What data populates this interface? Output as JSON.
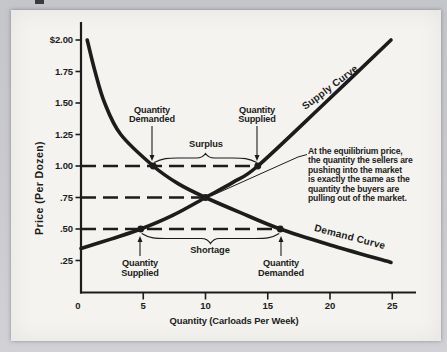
{
  "page": {
    "bg_outer": "#c9c9cd",
    "bg_page": "#f4f3ef",
    "ink": "#1c1c1c"
  },
  "chart_data": {
    "type": "line",
    "title": "",
    "xlabel": "Quantity (Carloads Per Week)",
    "ylabel": "Price (Per Dozen)",
    "xlim": [
      0,
      26
    ],
    "ylim": [
      0,
      2.15
    ],
    "grid": false,
    "legend": "labels-along-curves",
    "x_ticks": [
      {
        "label": "0",
        "q": 0
      },
      {
        "label": "5",
        "q": 5
      },
      {
        "label": "10",
        "q": 10
      },
      {
        "label": "15",
        "q": 15
      },
      {
        "label": "20",
        "q": 20
      },
      {
        "label": "25",
        "q": 25
      }
    ],
    "y_ticks": [
      {
        "label": "$2.00",
        "p": 2.0
      },
      {
        "label": "1.75",
        "p": 1.75
      },
      {
        "label": "1.50",
        "p": 1.5
      },
      {
        "label": "1.25",
        "p": 1.25
      },
      {
        "label": "1.00",
        "p": 1.0
      },
      {
        "label": ".75",
        "p": 0.75
      },
      {
        "label": ".50",
        "p": 0.5
      },
      {
        "label": ".25",
        "p": 0.25
      }
    ],
    "series": [
      {
        "name": "Supply Curve",
        "points": [
          [
            0,
            0.345
          ],
          [
            2.4,
            0.42
          ],
          [
            4.8,
            0.5
          ],
          [
            7.4,
            0.61
          ],
          [
            10,
            0.75
          ],
          [
            12.2,
            0.87
          ],
          [
            14.2,
            1.0
          ],
          [
            19.6,
            1.5
          ],
          [
            24.9,
            2.0
          ]
        ],
        "label_pos": {
          "x": 332,
          "y": 90,
          "angle": -37
        }
      },
      {
        "name": "Demand Curve",
        "points": [
          [
            0.5,
            2.0
          ],
          [
            1.1,
            1.76
          ],
          [
            1.9,
            1.5
          ],
          [
            3.2,
            1.25
          ],
          [
            5.8,
            1.0
          ],
          [
            7.8,
            0.86
          ],
          [
            10,
            0.75
          ],
          [
            12.8,
            0.63
          ],
          [
            16,
            0.5
          ],
          [
            20.3,
            0.365
          ],
          [
            24.9,
            0.235
          ]
        ],
        "label_pos": {
          "x": 349,
          "y": 240,
          "angle": 14.5
        }
      }
    ],
    "equilibrium": {
      "q": 10,
      "p": 0.75
    },
    "key_points": [
      {
        "q": 5.8,
        "p": 1.0
      },
      {
        "q": 14.2,
        "p": 1.0
      },
      {
        "q": 10,
        "p": 0.75
      },
      {
        "q": 4.8,
        "p": 0.5
      },
      {
        "q": 16,
        "p": 0.5
      }
    ],
    "price_lines": [
      {
        "p": 1.0,
        "from_q": 0,
        "to_q": 14.2
      },
      {
        "p": 0.75,
        "from_q": 0,
        "to_q": 10
      },
      {
        "p": 0.5,
        "from_q": 0,
        "to_q": 16
      }
    ],
    "braces": [
      {
        "label": "Surplus",
        "from_q": 5.8,
        "to_q": 14.2,
        "end_y": 162.5,
        "amp": 9,
        "label_x": 206,
        "label_y": 147
      },
      {
        "label": "Shortage",
        "from_q": 4.8,
        "to_q": 16,
        "end_y": 233.5,
        "amp": -10,
        "label_x": 210,
        "label_y": 253
      }
    ],
    "callouts": [
      {
        "lines": [
          "Quantity",
          "Demanded"
        ],
        "x": 152,
        "y1": 112.5,
        "arrow": {
          "x": 152,
          "y_from": 126,
          "y_to": 161
        }
      },
      {
        "lines": [
          "Quantity",
          "Supplied"
        ],
        "x": 257,
        "y1": 112.5,
        "arrow": {
          "x": 257,
          "y_from": 126,
          "y_to": 161
        }
      },
      {
        "lines": [
          "Quantity",
          "Supplied"
        ],
        "x": 140,
        "y1": 266,
        "arrow": {
          "x": 140,
          "y_from": 256,
          "y_to": 236
        }
      },
      {
        "lines": [
          "Quantity",
          "Demanded"
        ],
        "x": 281,
        "y1": 266,
        "arrow": {
          "x": 281,
          "y_from": 256,
          "y_to": 236
        }
      }
    ],
    "annotation": {
      "text": "At the equilibrium price,\nthe quantity the sellers are\npushing into the market\nis exactly the same as the\nquantity the buyers are\npulling out of the market.",
      "leader": [
        [
          211,
          196
        ],
        [
          298,
          157
        ],
        [
          307,
          154.5
        ]
      ]
    }
  }
}
